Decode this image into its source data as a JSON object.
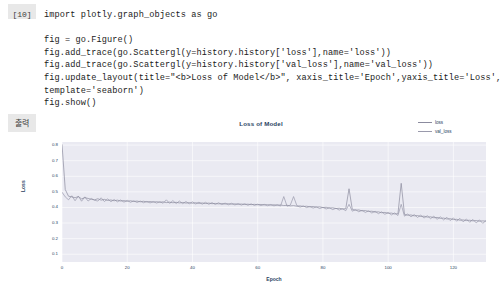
{
  "cell": {
    "prompt": "[10]",
    "output_label": "출력",
    "code_lines": [
      "import plotly.graph_objects as go",
      "",
      "fig = go.Figure()",
      "fig.add_trace(go.Scattergl(y=history.history['loss'],name='loss'))",
      "fig.add_trace(go.Scattergl(y=history.history['val_loss'],name='val_loss'))",
      "fig.update_layout(title=\"<b>Loss of Model</b>\", xaxis_title='Epoch',yaxis_title='Loss',",
      "template='seaborn')",
      "fig.show()"
    ]
  },
  "chart_data": {
    "type": "line",
    "title": "Loss of Model",
    "xlabel": "Epoch",
    "ylabel": "Loss",
    "xlim": [
      0,
      130
    ],
    "ylim": [
      0.05,
      0.82
    ],
    "xticks": [
      0,
      20,
      40,
      60,
      80,
      100,
      120
    ],
    "yticks": [
      "0.1",
      "0.2",
      "0.3",
      "0.4",
      "0.5",
      "0.6",
      "0.7",
      "0.8"
    ],
    "grid": true,
    "legend_position": "top-right",
    "colors": {
      "loss": "#8b8b9e",
      "val_loss": "#9a9aac",
      "plot_bg": "#eaeaf2",
      "grid": "#ffffff",
      "text": "#2a3f5f"
    },
    "series": [
      {
        "name": "loss",
        "color": "#8b8b9e",
        "values": [
          0.805,
          0.515,
          0.472,
          0.468,
          0.462,
          0.47,
          0.455,
          0.463,
          0.458,
          0.452,
          0.449,
          0.456,
          0.447,
          0.452,
          0.445,
          0.448,
          0.443,
          0.447,
          0.441,
          0.444,
          0.439,
          0.443,
          0.438,
          0.441,
          0.436,
          0.44,
          0.435,
          0.438,
          0.434,
          0.437,
          0.433,
          0.436,
          0.431,
          0.434,
          0.43,
          0.433,
          0.429,
          0.432,
          0.428,
          0.431,
          0.427,
          0.43,
          0.426,
          0.429,
          0.425,
          0.428,
          0.424,
          0.426,
          0.423,
          0.425,
          0.422,
          0.424,
          0.421,
          0.423,
          0.42,
          0.422,
          0.419,
          0.421,
          0.418,
          0.42,
          0.417,
          0.419,
          0.416,
          0.418,
          0.415,
          0.417,
          0.414,
          0.416,
          0.412,
          0.414,
          0.41,
          0.412,
          0.408,
          0.41,
          0.406,
          0.408,
          0.404,
          0.406,
          0.402,
          0.404,
          0.399,
          0.401,
          0.396,
          0.398,
          0.393,
          0.395,
          0.39,
          0.392,
          0.386,
          0.388,
          0.382,
          0.384,
          0.378,
          0.38,
          0.374,
          0.376,
          0.37,
          0.372,
          0.366,
          0.368,
          0.362,
          0.364,
          0.358,
          0.36,
          0.354,
          0.356,
          0.35,
          0.352,
          0.346,
          0.348,
          0.342,
          0.344,
          0.338,
          0.34,
          0.334,
          0.336,
          0.33,
          0.332,
          0.326,
          0.328,
          0.322,
          0.324,
          0.318,
          0.32,
          0.316,
          0.318,
          0.314,
          0.316,
          0.312,
          0.314,
          0.312
        ]
      },
      {
        "name": "val_loss",
        "color": "#9a9aac",
        "values": [
          0.498,
          0.468,
          0.449,
          0.475,
          0.443,
          0.472,
          0.44,
          0.468,
          0.441,
          0.458,
          0.446,
          0.441,
          0.462,
          0.438,
          0.455,
          0.437,
          0.451,
          0.436,
          0.448,
          0.434,
          0.446,
          0.433,
          0.443,
          0.432,
          0.441,
          0.43,
          0.439,
          0.429,
          0.438,
          0.428,
          0.437,
          0.427,
          0.449,
          0.426,
          0.444,
          0.425,
          0.441,
          0.424,
          0.438,
          0.423,
          0.436,
          0.422,
          0.434,
          0.421,
          0.433,
          0.42,
          0.431,
          0.419,
          0.43,
          0.418,
          0.428,
          0.417,
          0.427,
          0.416,
          0.425,
          0.415,
          0.424,
          0.414,
          0.423,
          0.413,
          0.421,
          0.412,
          0.42,
          0.411,
          0.419,
          0.41,
          0.418,
          0.409,
          0.47,
          0.408,
          0.415,
          0.405,
          0.412,
          0.402,
          0.41,
          0.399,
          0.406,
          0.396,
          0.404,
          0.393,
          0.401,
          0.39,
          0.398,
          0.386,
          0.395,
          0.383,
          0.392,
          0.379,
          0.42,
          0.376,
          0.386,
          0.372,
          0.382,
          0.368,
          0.379,
          0.364,
          0.376,
          0.36,
          0.372,
          0.356,
          0.369,
          0.352,
          0.365,
          0.348,
          0.42,
          0.344,
          0.358,
          0.34,
          0.354,
          0.336,
          0.351,
          0.332,
          0.347,
          0.328,
          0.344,
          0.324,
          0.34,
          0.32,
          0.337,
          0.316,
          0.333,
          0.312,
          0.33,
          0.308,
          0.326,
          0.305,
          0.323,
          0.301,
          0.32,
          0.298,
          0.316
        ]
      },
      {
        "name": "loss-spikes-annotation",
        "color": "#8b8b9e",
        "values": []
      }
    ],
    "spikes": [
      {
        "x": 71,
        "y": 0.47,
        "series": "val_loss"
      },
      {
        "x": 88,
        "y": 0.52,
        "series": "loss"
      },
      {
        "x": 104,
        "y": 0.555,
        "series": "loss"
      }
    ]
  },
  "legend": [
    {
      "label": "loss",
      "color": "#8b8b9e"
    },
    {
      "label": "val_loss",
      "color": "#9a9aac"
    }
  ]
}
